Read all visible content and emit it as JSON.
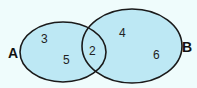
{
  "diagram": {
    "type": "venn",
    "colors": {
      "background": "#effcfc",
      "fill": "#bde8f4",
      "stroke": "#1a1a1a"
    },
    "sets": [
      {
        "name": "A",
        "label": "A",
        "only_elements": [
          "3",
          "5"
        ]
      },
      {
        "name": "B",
        "label": "B",
        "only_elements": [
          "4",
          "6"
        ]
      }
    ],
    "intersection": [
      "2"
    ],
    "elements": {
      "a1": "3",
      "a2": "5",
      "ab": "2",
      "b1": "4",
      "b2": "6"
    }
  }
}
